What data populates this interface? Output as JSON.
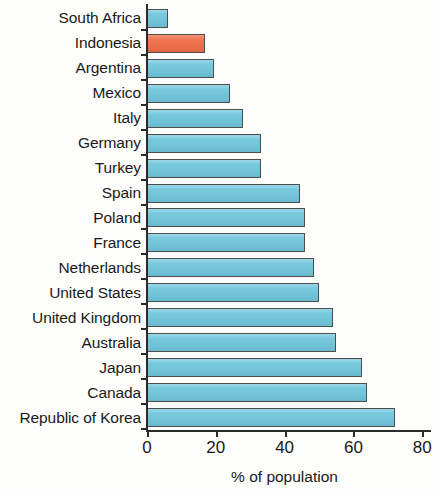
{
  "chart": {
    "type": "bar",
    "orientation": "horizontal",
    "x_axis_title": "% of population",
    "colors": {
      "bar": "#72c7dd",
      "highlight_bar": "#f0714a",
      "axis": "#2b2b2b",
      "background": "#fdfdfc",
      "text": "#1a1a1a"
    }
  },
  "chart_data": {
    "type": "bar",
    "title": "",
    "subtitle": "",
    "xlabel": "% of population",
    "ylabel": "",
    "xlim": [
      0,
      80
    ],
    "grid": false,
    "legend": null,
    "orientation": "horizontal",
    "xticks": [
      "0",
      "20",
      "40",
      "60",
      "80"
    ],
    "xtick_values": [
      0,
      20,
      40,
      60,
      80
    ],
    "categories": [
      "South Africa",
      "Indonesia",
      "Argentina",
      "Mexico",
      "Italy",
      "Germany",
      "Turkey",
      "Spain",
      "Poland",
      "France",
      "Netherlands",
      "United States",
      "United Kingdom",
      "Australia",
      "Japan",
      "Canada",
      "Republic of Korea"
    ],
    "values": [
      6,
      17,
      19.5,
      24,
      28,
      33,
      33,
      44.5,
      46,
      46,
      48.5,
      50,
      54,
      55,
      62.5,
      64,
      72
    ],
    "highlight_category": "Indonesia",
    "series": [
      {
        "name": "% of population",
        "values": [
          6,
          17,
          19.5,
          24,
          28,
          33,
          33,
          44.5,
          46,
          46,
          48.5,
          50,
          54,
          55,
          62.5,
          64,
          72
        ]
      }
    ]
  }
}
